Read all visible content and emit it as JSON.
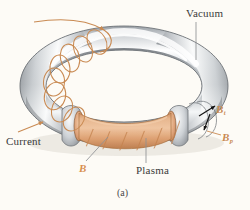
{
  "figure": {
    "caption": "(a)",
    "background_color": "#fdfbf6"
  },
  "labels": {
    "vacuum": "Vacuum",
    "current": "Current",
    "plasma": "Plasma",
    "b_field": "B",
    "b_toroidal": "B",
    "b_toroidal_sub": "t",
    "b_poloidal": "B",
    "b_poloidal_sub": "p"
  },
  "colors": {
    "torus_metal_light": "#ffffff",
    "torus_metal_mid": "#c9ccd0",
    "torus_metal_dark": "#8e9398",
    "torus_outline": "#6f7478",
    "plasma_light": "#e8b48e",
    "plasma_mid": "#d79a6e",
    "plasma_dark": "#c08355",
    "coil_wire": "#c98a52",
    "leader_line": "#8e9094",
    "arrow_black": "#1a1a1a",
    "label_text": "#3a3a3a"
  },
  "geometry": {
    "torus_center_x": 124,
    "torus_center_y": 86,
    "torus_outer_rx": 104,
    "torus_outer_ry": 60,
    "tube_thickness": 21,
    "coil_turns": 8,
    "plasma_stripes": 6
  }
}
